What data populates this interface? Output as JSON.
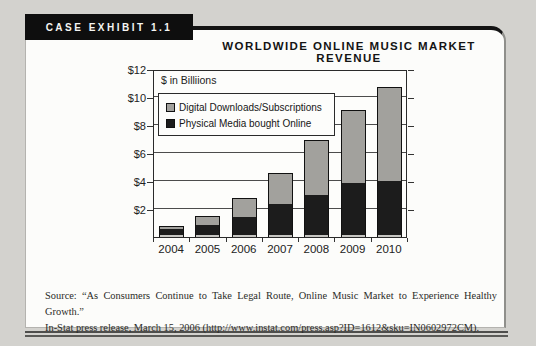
{
  "exhibit": {
    "tab_label": "CASE EXHIBIT 1.1",
    "title": "WORLDWIDE ONLINE MUSIC MARKET REVENUE"
  },
  "chart_data": {
    "type": "bar",
    "stacked": true,
    "title": "Worldwide Online Music Market Revenue",
    "unit_note": "$ in Billiions",
    "categories": [
      "2004",
      "2005",
      "2006",
      "2007",
      "2008",
      "2009",
      "2010"
    ],
    "series": [
      {
        "name": "Digital Downloads/Subscriptions",
        "color": "#a2a19d",
        "values": [
          0.2,
          0.6,
          1.3,
          2.2,
          3.9,
          5.2,
          6.7
        ]
      },
      {
        "name": "Physical Media bought Online",
        "color": "#1c1c1c",
        "values": [
          0.6,
          0.9,
          1.5,
          2.4,
          3.0,
          3.9,
          4.0
        ]
      }
    ],
    "totals": [
      0.8,
      1.5,
      2.8,
      4.6,
      6.9,
      9.1,
      10.7
    ],
    "ylim": [
      0,
      12
    ],
    "ytick_values": [
      2,
      4,
      6,
      8,
      10,
      12
    ],
    "ytick_labels": [
      "$2",
      "$4",
      "$6",
      "$8",
      "$10",
      "$12"
    ],
    "grid": "horizontal",
    "legend_position": "top-left-inside"
  },
  "source": {
    "line1": "Source: “As Consumers Continue to Take Legal Route, Online Music Market to Experience Healthy Growth.”",
    "line2": "In-Stat press release, March 15, 2006 (http://www.instat.com/press.asp?ID=1612&sku=IN0602972CM)."
  }
}
